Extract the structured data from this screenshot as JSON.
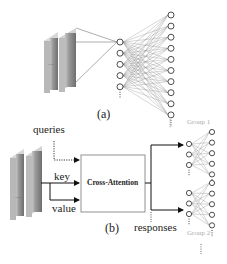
{
  "panel_a": {
    "caption": "(a)",
    "feature_maps_count": 2,
    "input_layer_nodes": 5,
    "output_layer_nodes": 10,
    "ellipsis": "⋮"
  },
  "panel_b": {
    "caption": "(b)",
    "inputs": {
      "queries": "queries",
      "key": "key",
      "value": "value"
    },
    "module_label": "Cross-Attention",
    "output_label": "responses",
    "groups": [
      {
        "label": "Group 1",
        "input_nodes": 3,
        "output_nodes": 5
      },
      {
        "label": "Group 2",
        "input_nodes": 3,
        "output_nodes": 5
      }
    ],
    "ellipsis": "⋮"
  },
  "colors": {
    "line": "#333333",
    "mesh": "#888888",
    "group_label": "#aaaaaa",
    "feature_map_dark": "#7d7d7d",
    "feature_map_light": "#b5b5b5"
  }
}
